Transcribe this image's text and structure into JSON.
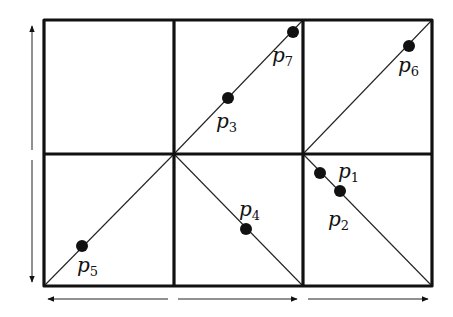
{
  "diagram": {
    "colors": {
      "stroke": "#111111",
      "background": "#ffffff",
      "point": "#111111"
    },
    "grid": {
      "x": [
        44,
        174,
        303,
        432
      ],
      "y": [
        20,
        154,
        286
      ]
    },
    "points": [
      {
        "name": "p1",
        "base": "p",
        "sub": "1",
        "cx": 320,
        "cy": 173,
        "lx": 338,
        "ly": 178
      },
      {
        "name": "p2",
        "base": "p",
        "sub": "2",
        "cx": 340,
        "cy": 191,
        "lx": 328,
        "ly": 226
      },
      {
        "name": "p3",
        "base": "p",
        "sub": "3",
        "cx": 228,
        "cy": 98,
        "lx": 216,
        "ly": 128
      },
      {
        "name": "p4",
        "base": "p",
        "sub": "4",
        "cx": 246,
        "cy": 229,
        "lx": 239,
        "ly": 216
      },
      {
        "name": "p5",
        "base": "p",
        "sub": "5",
        "cx": 82,
        "cy": 246,
        "lx": 77,
        "ly": 272
      },
      {
        "name": "p6",
        "base": "p",
        "sub": "6",
        "cx": 409,
        "cy": 46,
        "lx": 398,
        "ly": 72
      },
      {
        "name": "p7",
        "base": "p",
        "sub": "7",
        "cx": 293,
        "cy": 32,
        "lx": 272,
        "ly": 62
      }
    ],
    "arrows": {
      "vertical": [
        {
          "direction": "up",
          "x": 32,
          "y1": 150,
          "y2": 26
        },
        {
          "direction": "down",
          "x": 32,
          "y1": 160,
          "y2": 282
        }
      ],
      "horizontal": [
        {
          "direction": "left",
          "y": 299,
          "x1": 168,
          "x2": 48
        },
        {
          "direction": "right",
          "y": 299,
          "x1": 178,
          "x2": 297
        },
        {
          "direction": "right",
          "y": 299,
          "x1": 308,
          "x2": 428
        }
      ]
    }
  }
}
